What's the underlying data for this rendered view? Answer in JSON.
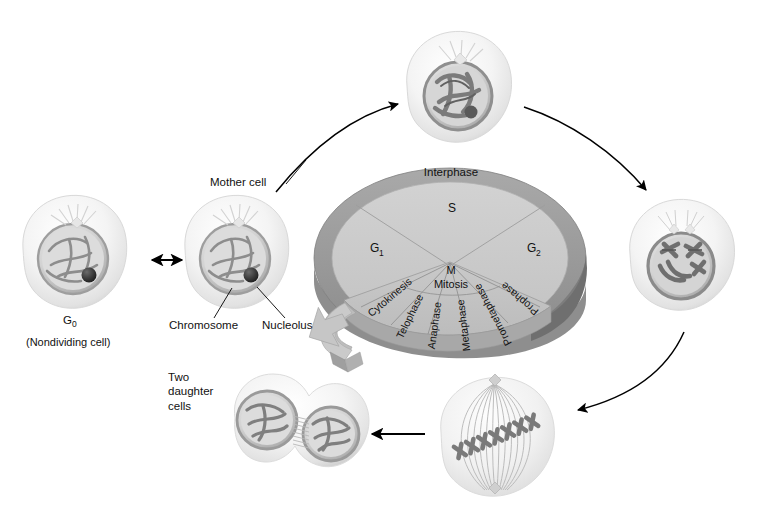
{
  "diagram": {
    "background_color": "#ffffff",
    "wheel": {
      "interphase_label": "Interphase",
      "ring_color": "#9a9a9a",
      "ring_shadow_color": "#6f6f6f",
      "disc_color": "#cbcbcb",
      "disc_edge_color": "#b3b3b3",
      "mitosis_sector_color": "#c2c2c2",
      "arrow_color": "#bdbdbd",
      "interphase_sectors": [
        {
          "label": "G",
          "subscript": "1",
          "name": "g1-sector"
        },
        {
          "label": "S",
          "subscript": "",
          "name": "s-sector"
        },
        {
          "label": "G",
          "subscript": "2",
          "name": "g2-sector"
        }
      ],
      "m_phase": {
        "short_label": "M",
        "long_label": "Mitosis",
        "sectors": [
          "Cytokinesis",
          "Telophase",
          "Anaphase",
          "Metaphase",
          "Prometaphase",
          "Prophase"
        ]
      }
    },
    "labels": {
      "g0": "G",
      "g0_sub": "0",
      "g0_caption": "(Nondividing cell)",
      "mother_cell": "Mother cell",
      "chromosome": "Chromosome",
      "nucleolus": "Nucleolus",
      "two_daughter_cells": "Two\ndaughter\ncells",
      "two_daughter_cells_line1": "Two",
      "two_daughter_cells_line2": "daughter",
      "two_daughter_cells_line3": "cells"
    },
    "cells": [
      {
        "name": "g0-cell",
        "stage": "G0 nondividing cell"
      },
      {
        "name": "mother-cell",
        "stage": "Interphase mother cell"
      },
      {
        "name": "prophase-cell",
        "stage": "Prophase"
      },
      {
        "name": "prometaphase-cell",
        "stage": "Prometaphase"
      },
      {
        "name": "metaphase-cell",
        "stage": "Metaphase"
      },
      {
        "name": "daughter-cells",
        "stage": "Two daughter cells"
      }
    ],
    "arrows": [
      {
        "name": "arrow-g0-mother",
        "kind": "double-headed"
      },
      {
        "name": "arrow-mother-to-prophase",
        "kind": "curved"
      },
      {
        "name": "arrow-prophase-to-prometaphase",
        "kind": "curved"
      },
      {
        "name": "arrow-prometaphase-to-metaphase",
        "kind": "curved"
      },
      {
        "name": "arrow-metaphase-to-daughters",
        "kind": "straight"
      }
    ]
  }
}
